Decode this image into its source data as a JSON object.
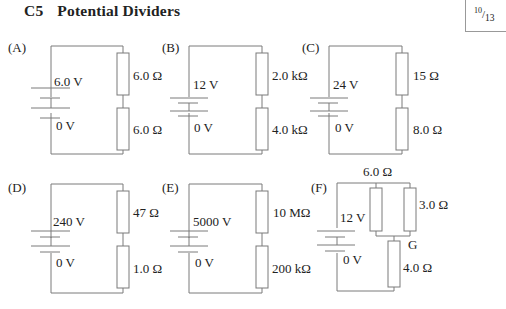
{
  "header": {
    "section_number": "C5",
    "title": "Potential Dividers",
    "page": {
      "current": "10",
      "total": "13"
    }
  },
  "circuits": [
    {
      "label": "(A)",
      "supply_high": "6.0 V",
      "supply_low": "0 V",
      "r_top": "6.0 Ω",
      "r_bottom": "6.0 Ω"
    },
    {
      "label": "(B)",
      "supply_high": "12 V",
      "supply_low": "0 V",
      "r_top": "2.0 kΩ",
      "r_bottom": "4.0 kΩ"
    },
    {
      "label": "(C)",
      "supply_high": "24 V",
      "supply_low": "0 V",
      "r_top": "15 Ω",
      "r_bottom": "8.0 Ω"
    },
    {
      "label": "(D)",
      "supply_high": "240 V",
      "supply_low": "0 V",
      "r_top": "47 Ω",
      "r_bottom": "1.0 Ω"
    },
    {
      "label": "(E)",
      "supply_high": "5000 V",
      "supply_low": "0 V",
      "r_top": "10 MΩ",
      "r_bottom": "200 kΩ"
    },
    {
      "label": "(F)",
      "supply_high": "12 V",
      "supply_low": "0 V",
      "r_parallel_left": "6.0 Ω",
      "r_parallel_right": "3.0 Ω",
      "node_label": "G",
      "r_bottom": "4.0 Ω"
    }
  ],
  "colors": {
    "wire": "#7a7a7a",
    "text": "#222222",
    "background": "#ffffff"
  }
}
